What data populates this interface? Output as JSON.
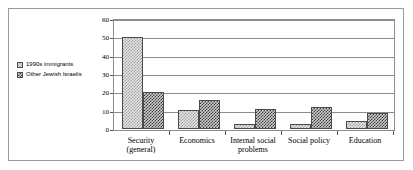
{
  "chart_data": {
    "type": "bar",
    "title": "",
    "subtitle": "",
    "xlabel": "",
    "ylabel": "",
    "ylim": [
      0,
      60
    ],
    "ytick_step": 10,
    "yticks": [
      "0",
      "10",
      "20",
      "30",
      "40",
      "50",
      "60"
    ],
    "grid": true,
    "legend_position": "left-outside",
    "categories": [
      "Security (general)",
      "Economics",
      "Internal social problems",
      "Social policy",
      "Education"
    ],
    "series": [
      {
        "name": "1990s immigrants",
        "swatch_color": "#e8e8e8",
        "values": [
          50,
          10.5,
          3,
          2.5,
          4.5
        ]
      },
      {
        "name": "Other Jewish Israelis",
        "swatch_color": "#cfcfcf",
        "values": [
          20,
          16,
          11,
          12,
          8.5
        ]
      }
    ]
  }
}
